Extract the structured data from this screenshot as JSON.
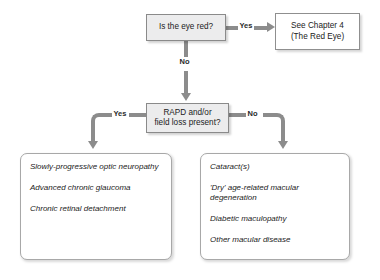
{
  "diagram": {
    "type": "decision-flowchart",
    "nodes": {
      "eye_red": "Is the eye red?",
      "chapter_ref_line1": "See Chapter 4",
      "chapter_ref_line2": "(The Red Eye)",
      "rapd_line1": "RAPD and/or",
      "rapd_line2": "field loss present?"
    },
    "edges": {
      "eye_red_yes": "Yes",
      "eye_red_no": "No",
      "rapd_yes": "Yes",
      "rapd_no": "No"
    },
    "outcomes_left": [
      "Slowly-progressive optic neuropathy",
      "Advanced chronic glaucoma",
      "Chronic retinal detachment"
    ],
    "outcomes_right": [
      "Cataract(s)",
      "'Dry' age-related macular degeneration",
      "Diabetic maculopathy",
      "Other macular disease"
    ],
    "colors": {
      "connector": "#8c8c8c",
      "decision_fill": "#ececed",
      "border": "#8a8a8a",
      "text": "#1b1b1b"
    }
  }
}
